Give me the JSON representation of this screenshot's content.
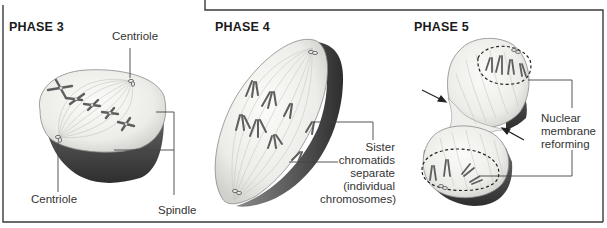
{
  "figure": {
    "colors": {
      "border": "#3a3a3a",
      "cell_fill": "#f2f2ef",
      "cell_shadow": "#4a4a4a",
      "chromosome": "#6e6e6e",
      "leader_line": "#444444"
    }
  },
  "panels": [
    {
      "id": "phase3",
      "title": "PHASE 3",
      "labels": {
        "centriole_top": "Centriole",
        "centriole_bottom": "Centriole",
        "spindle": "Spindle"
      }
    },
    {
      "id": "phase4",
      "title": "PHASE 4",
      "labels": {
        "sister_line1": "Sister",
        "sister_line2": "chromatids",
        "sister_line3": "separate",
        "sister_line4": "(individual",
        "sister_line5": "chromosomes)"
      }
    },
    {
      "id": "phase5",
      "title": "PHASE 5",
      "labels": {
        "nuclear_line1": "Nuclear",
        "nuclear_line2": "membrane",
        "nuclear_line3": "reforming"
      }
    }
  ]
}
